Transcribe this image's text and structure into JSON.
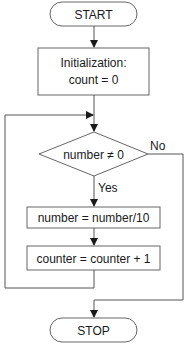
{
  "flowchart": {
    "start": {
      "label": "START"
    },
    "init": {
      "line1": "Initialization:",
      "line2": "count = 0"
    },
    "decision": {
      "label": "number ≠ 0",
      "yes_label": "Yes",
      "no_label": "No"
    },
    "step1": {
      "label": "number = number/10"
    },
    "step2": {
      "label": "counter = counter + 1"
    },
    "stop": {
      "label": "STOP"
    }
  },
  "colors": {
    "stroke": "#555555",
    "text": "#1a1a1a",
    "background": "#ffffff"
  }
}
